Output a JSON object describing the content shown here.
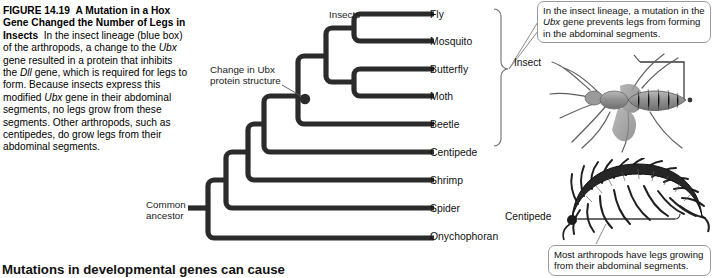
{
  "figure": {
    "number": "FIGURE 14.19",
    "title": "A Mutation in a Hox Gene Changed the Number of Legs in Insects",
    "caption_part1": "In the insect lineage (blue box) of the arthropods, a change to the ",
    "caption_gene1": "Ubx",
    "caption_part2": " gene resulted in a protein that inhibits the ",
    "caption_gene2": "Dll",
    "caption_part3": " gene, which is required for legs to form. Because insects express this modified ",
    "caption_gene3": "Ubx",
    "caption_part4": " gene in their abdominal segments, no legs grow from these segments. Other arthropods, such as centipedes, do grow legs from their abdominal segments."
  },
  "tree": {
    "taxa": [
      {
        "label": "Fly",
        "y": 14
      },
      {
        "label": "Mosquito",
        "y": 41
      },
      {
        "label": "Butterfly",
        "y": 69
      },
      {
        "label": "Moth",
        "y": 96
      },
      {
        "label": "Beetle",
        "y": 124
      },
      {
        "label": "Centipede",
        "y": 152
      },
      {
        "label": "Shrimp",
        "y": 180
      },
      {
        "label": "Spider",
        "y": 208
      },
      {
        "label": "Onychophoran",
        "y": 236
      }
    ],
    "clade_label": "Insects",
    "node_annotation_line1": "Change in Ubx",
    "node_annotation_line2": "protein structure",
    "root_label_line1": "Common",
    "root_label_line2": "ancestor"
  },
  "callouts": {
    "top_line1": "In the insect lineage, a mutation in the",
    "top_gene": "Ubx",
    "top_line2_rest": " gene prevents legs from forming in",
    "top_line3": "the abdominal segments.",
    "bottom_line1": "Most arthropods have legs growing",
    "bottom_line2": "from their abdominal segments."
  },
  "photos": {
    "insect_label": "Insect",
    "centipede_label": "Centipede"
  },
  "running_head": "Mutations in developmental genes can cause",
  "colors": {
    "ink": "#1a1a1a",
    "branch": "#2b2b2b",
    "callout_border": "#9a9a9a",
    "leader": "#7d7d7d"
  }
}
